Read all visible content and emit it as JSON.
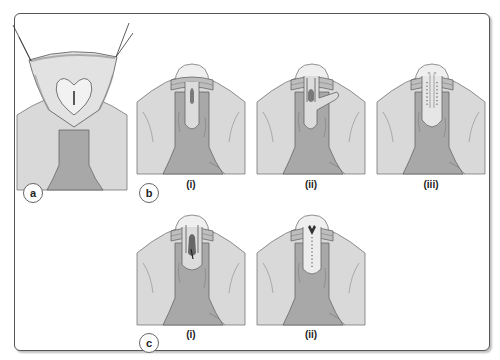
{
  "figure": {
    "panels": [
      {
        "id": "a",
        "label": "a",
        "subpanels": [
          {
            "label": ""
          }
        ]
      },
      {
        "id": "b",
        "label": "b",
        "subpanels": [
          {
            "label": "(i)"
          },
          {
            "label": "(ii)"
          },
          {
            "label": "(iii)"
          }
        ]
      },
      {
        "id": "c",
        "label": "c",
        "subpanels": [
          {
            "label": "(i)"
          },
          {
            "label": "(ii)"
          }
        ]
      }
    ],
    "colors": {
      "background": "#ffffff",
      "frame": "#555555",
      "skin_light": "#d9d9d9",
      "shaft": "#a8a8a8",
      "glans": "#efefef",
      "outline": "#666666",
      "collar": "#bdbdbd",
      "dark": "#444444"
    }
  }
}
